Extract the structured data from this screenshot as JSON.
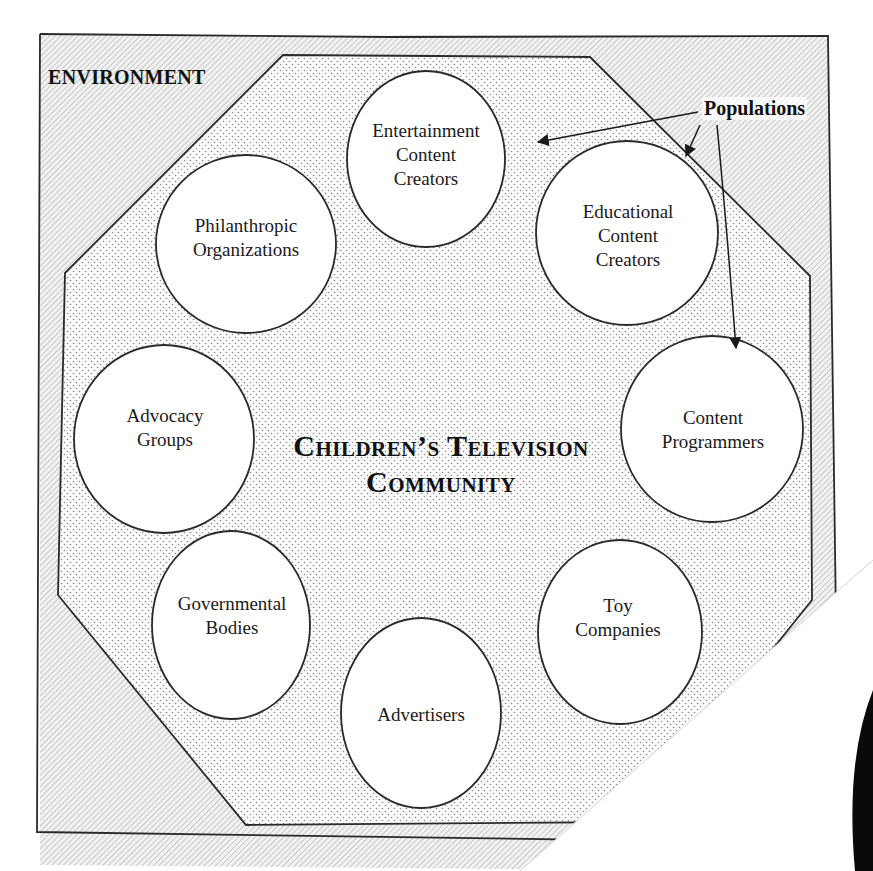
{
  "diagram": {
    "environment_label": "ENVIRONMENT",
    "populations_label": "Populations",
    "community_title": {
      "line1": "Children’s Television",
      "line2": "Community"
    },
    "populations": [
      {
        "id": "entertainment",
        "lines": [
          "Entertainment",
          "Content",
          "Creators"
        ]
      },
      {
        "id": "educational",
        "lines": [
          "Educational",
          "Content",
          "Creators"
        ]
      },
      {
        "id": "programmers",
        "lines": [
          "Content",
          "Programmers"
        ]
      },
      {
        "id": "toy",
        "lines": [
          "Toy",
          "Companies"
        ]
      },
      {
        "id": "advertisers",
        "lines": [
          "Advertisers"
        ]
      },
      {
        "id": "governmental",
        "lines": [
          "Governmental",
          "Bodies"
        ]
      },
      {
        "id": "advocacy",
        "lines": [
          "Advocacy",
          "Groups"
        ]
      },
      {
        "id": "philanthropic",
        "lines": [
          "Philanthropic",
          "Organizations"
        ]
      }
    ],
    "colors": {
      "line": "#2a2a2a",
      "environment_fill": "#d9d9d9",
      "community_fill": "#eeeeee",
      "circle_fill": "#ffffff"
    }
  }
}
